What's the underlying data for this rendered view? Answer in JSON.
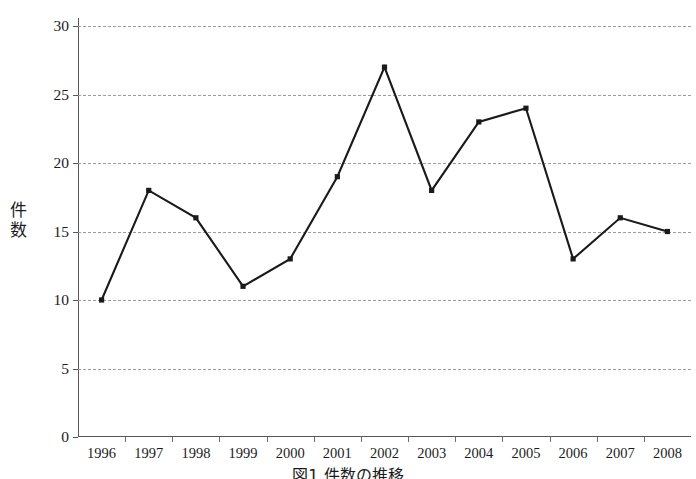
{
  "chart_data": {
    "type": "line",
    "title": "",
    "xlabel": "",
    "ylabel": "件数",
    "categories": [
      "1996",
      "1997",
      "1998",
      "1999",
      "2000",
      "2001",
      "2002",
      "2003",
      "2004",
      "2005",
      "2006",
      "2007",
      "2008"
    ],
    "values": [
      10,
      18,
      16,
      11,
      13,
      19,
      27,
      18,
      23,
      24,
      13,
      16,
      15
    ],
    "series": [
      {
        "name": "件数",
        "values": [
          10,
          18,
          16,
          11,
          13,
          19,
          27,
          18,
          23,
          24,
          13,
          16,
          15
        ]
      }
    ],
    "ylim": [
      0,
      30
    ],
    "yticks": [
      0,
      5,
      10,
      15,
      20,
      25,
      30
    ],
    "ytick_labels": [
      "0",
      "5",
      "10",
      "15",
      "20",
      "25",
      "30"
    ],
    "grid": "horizontal-dashed",
    "legend": "none",
    "line_color": "#1a1a1a",
    "marker": "square",
    "marker_color": "#1a1a1a"
  },
  "axes": {
    "y_label_chars": [
      "件",
      "数"
    ],
    "axis_color": "#575757",
    "grid_color": "#9d9d9d"
  },
  "caption": {
    "text": "図1 件数の推移"
  }
}
